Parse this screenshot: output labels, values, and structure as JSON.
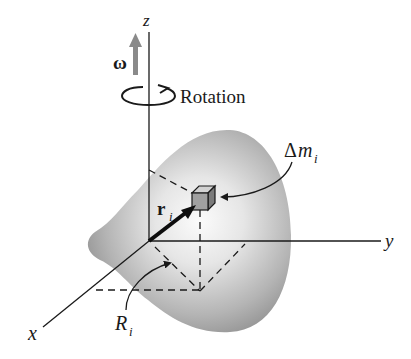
{
  "figure": {
    "type": "rigid-body-rotation-diagram",
    "labels": {
      "z_axis": "z",
      "y_axis": "y",
      "x_axis": "x",
      "omega": "ω",
      "rotation": "Rotation",
      "mass_element_delta": "Δ",
      "mass_element_m": "m",
      "mass_element_sub": "i",
      "position_vector": "r",
      "position_vector_sub": "i",
      "perp_distance": "R",
      "perp_distance_sub": "i"
    },
    "colors": {
      "body_fill_light": "#f4f4f4",
      "body_fill_dark": "#8c8c8c",
      "axis": "#1a1a1a",
      "omega_arrow": "#8a8a8a",
      "cube_front": "#9a9a9a",
      "cube_top": "#c8c8c8",
      "cube_side": "#7a7a7a"
    }
  }
}
